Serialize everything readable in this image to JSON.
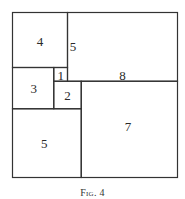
{
  "figure": {
    "caption": "Fig. 4",
    "line_color": "#333333",
    "background": "#ffffff",
    "grid_units": 12,
    "origin_px": [
      12.5,
      12.5
    ],
    "unit_px": 13.75,
    "regions": [
      {
        "id": "sq4",
        "x": 0,
        "y": 0,
        "w": 4,
        "h": 4,
        "label": "4",
        "label_pos": [
          2,
          2.1
        ]
      },
      {
        "id": "rect8x5",
        "x": 4,
        "y": 0,
        "w": 8,
        "h": 5,
        "label": "8",
        "label_pos": [
          8,
          4.55
        ]
      },
      {
        "id": "sq3",
        "x": 0,
        "y": 4,
        "w": 3,
        "h": 3,
        "label": "3",
        "label_pos": [
          1.55,
          5.55
        ]
      },
      {
        "id": "sq1",
        "x": 3,
        "y": 4,
        "w": 1,
        "h": 1,
        "label": "1",
        "label_pos": [
          3.5,
          4.55
        ]
      },
      {
        "id": "sq2",
        "x": 3,
        "y": 5,
        "w": 2,
        "h": 2,
        "label": "2",
        "label_pos": [
          4.0,
          6.05
        ]
      },
      {
        "id": "sq7",
        "x": 5,
        "y": 5,
        "w": 7,
        "h": 7,
        "label": "7",
        "label_pos": [
          8.4,
          8.3
        ]
      },
      {
        "id": "sq5",
        "x": 0,
        "y": 7,
        "w": 5,
        "h": 5,
        "label": "5",
        "label_pos": [
          2.3,
          9.55
        ]
      }
    ],
    "side_labels": [
      {
        "id": "rect8x5-height",
        "label": "5",
        "label_pos": [
          4.4,
          2.45
        ]
      }
    ]
  }
}
